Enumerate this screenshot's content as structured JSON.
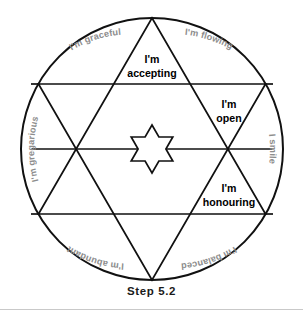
{
  "figure": {
    "caption": "Step 5.2",
    "center_icon": "six-pointed-star-icon",
    "geometry": {
      "circle_center_x": 152,
      "circle_center_y": 149,
      "circle_radius": 131,
      "star_points": 6
    },
    "colors": {
      "stroke": "#111111",
      "background": "#ffffff",
      "arc_label_text": "#8d8d8d",
      "inner_label_text": "#000000",
      "rule": "#c9c9c9"
    }
  },
  "arc_labels": [
    {
      "id": "graceful",
      "text": "I'm graceful",
      "position": "top-left"
    },
    {
      "id": "flowing",
      "text": "I'm flowing",
      "position": "top-right"
    },
    {
      "id": "smile",
      "text": "I smile",
      "position": "right"
    },
    {
      "id": "balanced",
      "text": "I'm balanced",
      "position": "bottom-right"
    },
    {
      "id": "abundant",
      "text": "I'm abundant",
      "position": "bottom-left"
    },
    {
      "id": "gregarious",
      "text": "I'm gregarious",
      "position": "left"
    }
  ],
  "inner_labels": [
    {
      "id": "accepting",
      "line1": "I'm",
      "line2": "accepting",
      "position": "top"
    },
    {
      "id": "open",
      "line1": "I'm",
      "line2": "open",
      "position": "upper-right"
    },
    {
      "id": "honouring",
      "line1": "I'm",
      "line2": "honouring",
      "position": "lower-right"
    }
  ]
}
